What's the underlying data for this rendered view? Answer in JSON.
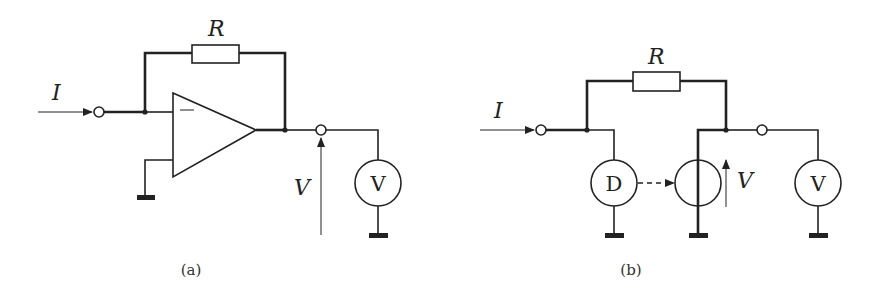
{
  "figure": {
    "panel_a": {
      "caption": "(a)",
      "labels": {
        "current": "I",
        "resistor": "R",
        "voltage": "V",
        "voltmeter": "V",
        "opamp_inverting": "−"
      },
      "components": [
        "input-terminal",
        "feedback-resistor",
        "op-amp",
        "output-terminal",
        "voltmeter",
        "ground"
      ]
    },
    "panel_b": {
      "caption": "(b)",
      "labels": {
        "current": "I",
        "resistor": "R",
        "voltage": "V",
        "voltmeter": "V",
        "detector": "D"
      },
      "components": [
        "input-terminal",
        "feedback-resistor",
        "detector",
        "controlled-voltage-source",
        "output-terminal",
        "voltmeter",
        "ground"
      ]
    },
    "colors": {
      "line": "#222222",
      "background": "#ffffff"
    }
  }
}
